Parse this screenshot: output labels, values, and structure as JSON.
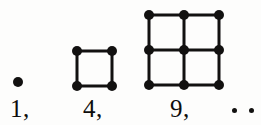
{
  "figure": {
    "background_color": "#fdfdfc",
    "ink_color": "#121110",
    "dot_spacing_px": 35,
    "dot_radius_px": 5,
    "line_width_px": 3,
    "terms": [
      {
        "name": "term-1",
        "label": "1,",
        "value": 1,
        "grid_side": 1,
        "dot_count": 1,
        "origin": {
          "x": 18,
          "y": 82
        },
        "label_pos": {
          "x": 10,
          "y": 96
        }
      },
      {
        "name": "term-4",
        "label": "4,",
        "value": 4,
        "grid_side": 2,
        "dot_count": 4,
        "origin": {
          "x": 77,
          "y": 51
        },
        "label_pos": {
          "x": 83,
          "y": 96
        }
      },
      {
        "name": "term-9",
        "label": "9,",
        "value": 9,
        "grid_side": 3,
        "dot_count": 9,
        "origin": {
          "x": 149,
          "y": 15
        },
        "label_pos": {
          "x": 170,
          "y": 96
        }
      }
    ],
    "ellipsis": {
      "label": ". .",
      "dot_count": 2,
      "dots": [
        {
          "x": 232,
          "y": 108
        },
        {
          "x": 249,
          "y": 108
        }
      ]
    },
    "sequence_caption": "1, 4, 9, . ."
  },
  "chart_data": {
    "type": "scatter",
    "categories": [
      "1",
      "4",
      "9"
    ],
    "values": [
      1,
      4,
      9
    ],
    "series": [
      {
        "name": "dot count",
        "values": [
          1,
          4,
          9
        ]
      },
      {
        "name": "grid side",
        "values": [
          1,
          2,
          3
        ]
      }
    ],
    "annotations": [
      "1,",
      "4,",
      "9,",
      ". ."
    ],
    "xlabel": "",
    "ylabel": "",
    "grid": true,
    "legend": "none"
  }
}
